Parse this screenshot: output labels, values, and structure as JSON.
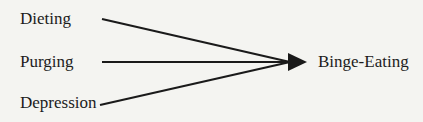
{
  "diagram": {
    "type": "flow",
    "sources": [
      {
        "id": "dieting",
        "label": "Dieting"
      },
      {
        "id": "purging",
        "label": "Purging"
      },
      {
        "id": "depression",
        "label": "Depression"
      }
    ],
    "target": {
      "id": "binge-eating",
      "label": "Binge-Eating"
    },
    "edges": [
      {
        "from": "dieting",
        "to": "binge-eating"
      },
      {
        "from": "purging",
        "to": "binge-eating"
      },
      {
        "from": "depression",
        "to": "binge-eating"
      }
    ],
    "colors": {
      "line": "#1a1a1a",
      "background": "#f4f4f1",
      "text": "#1c1c1c"
    }
  }
}
